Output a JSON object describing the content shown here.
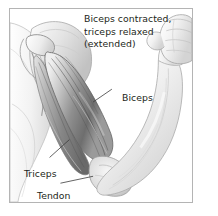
{
  "figure": {
    "title": "Biceps contracted, triceps relaxed (extended)",
    "caption_lines": [
      "Biceps contracted,",
      "triceps relaxed",
      "(extended)"
    ],
    "style": "grayscale medical line-and-wash illustration",
    "border_color": "#b4b4b4",
    "background_color": "#ffffff",
    "text_color": "#231f20",
    "labels": [
      {
        "id": "biceps",
        "text": "Biceps",
        "anchor": "biceps muscle belly",
        "leader": {
          "x1": 110,
          "y1": 89,
          "x2": 93,
          "y2": 102
        }
      },
      {
        "id": "triceps",
        "text": "Triceps",
        "anchor": "triceps muscle on the back of the upper arm",
        "leader": {
          "x1": 49,
          "y1": 158,
          "x2": 69,
          "y2": 140
        }
      },
      {
        "id": "tendon",
        "text": "Tendon",
        "anchor": "distal biceps tendon at the elbow",
        "leader": {
          "x1": 60,
          "y1": 184,
          "x2": 92,
          "y2": 176
        }
      }
    ],
    "anatomy_parts": [
      "shoulder / scapula",
      "clavicle",
      "deltoid",
      "biceps brachii (contracted)",
      "triceps brachii (relaxed, extended)",
      "tendon",
      "elbow joint",
      "forearm",
      "clenched fist"
    ]
  }
}
